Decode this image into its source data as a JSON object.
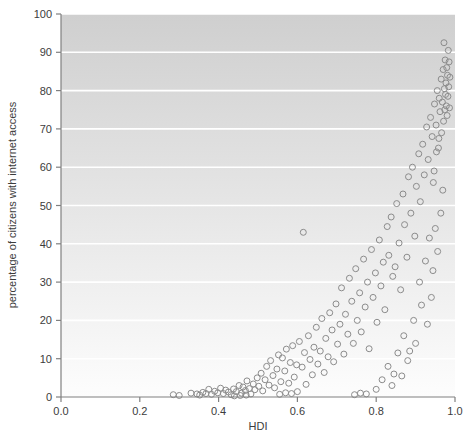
{
  "chart_data": {
    "type": "scatter",
    "title": "",
    "xlabel": "HDI",
    "ylabel": "percentage of citizens with internet access",
    "xlim": [
      0.0,
      1.0
    ],
    "ylim": [
      0,
      100
    ],
    "xticks": [
      "0.0",
      "0.2",
      "0.4",
      "0.6",
      "0.8",
      "1.0"
    ],
    "xtick_values": [
      0.0,
      0.2,
      0.4,
      0.6,
      0.8,
      1.0
    ],
    "yticks": [
      "0",
      "10",
      "20",
      "30",
      "40",
      "50",
      "60",
      "70",
      "80",
      "90",
      "100"
    ],
    "ytick_values": [
      0,
      10,
      20,
      30,
      40,
      50,
      60,
      70,
      80,
      90,
      100
    ],
    "grid": "horizontal-white",
    "legend": "none",
    "marker": "open-circle",
    "marker_color": "#8c8c8c",
    "marker_radius": 3.0,
    "plot_bg_gradient": [
      "#cfcfcf",
      "#fcfcfc"
    ],
    "axis_color": "#808080",
    "points": [
      [
        0.285,
        0.6
      ],
      [
        0.3,
        0.4
      ],
      [
        0.33,
        1.0
      ],
      [
        0.345,
        0.8
      ],
      [
        0.352,
        0.5
      ],
      [
        0.36,
        1.2
      ],
      [
        0.368,
        0.9
      ],
      [
        0.375,
        2.0
      ],
      [
        0.382,
        0.7
      ],
      [
        0.39,
        1.5
      ],
      [
        0.398,
        1.1
      ],
      [
        0.405,
        2.3
      ],
      [
        0.412,
        0.9
      ],
      [
        0.418,
        1.8
      ],
      [
        0.425,
        1.3
      ],
      [
        0.432,
        0.6
      ],
      [
        0.438,
        2.1
      ],
      [
        0.445,
        1.4
      ],
      [
        0.452,
        3.0
      ],
      [
        0.458,
        1.0
      ],
      [
        0.462,
        2.6
      ],
      [
        0.468,
        1.7
      ],
      [
        0.472,
        4.2
      ],
      [
        0.478,
        2.2
      ],
      [
        0.482,
        0.8
      ],
      [
        0.488,
        3.4
      ],
      [
        0.492,
        1.9
      ],
      [
        0.498,
        5.0
      ],
      [
        0.47,
        0.5
      ],
      [
        0.455,
        0.4
      ],
      [
        0.44,
        0.3
      ],
      [
        0.502,
        2.8
      ],
      [
        0.508,
        6.2
      ],
      [
        0.512,
        1.6
      ],
      [
        0.518,
        4.5
      ],
      [
        0.522,
        8.0
      ],
      [
        0.528,
        3.1
      ],
      [
        0.532,
        9.5
      ],
      [
        0.538,
        5.6
      ],
      [
        0.542,
        2.4
      ],
      [
        0.548,
        7.3
      ],
      [
        0.552,
        11.0
      ],
      [
        0.558,
        4.0
      ],
      [
        0.562,
        10.2
      ],
      [
        0.568,
        6.8
      ],
      [
        0.572,
        12.5
      ],
      [
        0.578,
        3.6
      ],
      [
        0.582,
        9.0
      ],
      [
        0.588,
        13.4
      ],
      [
        0.592,
        5.2
      ],
      [
        0.598,
        8.4
      ],
      [
        0.555,
        0.7
      ],
      [
        0.57,
        1.1
      ],
      [
        0.585,
        0.9
      ],
      [
        0.6,
        1.4
      ],
      [
        0.605,
        14.5
      ],
      [
        0.612,
        7.8
      ],
      [
        0.618,
        11.6
      ],
      [
        0.622,
        3.3
      ],
      [
        0.628,
        16.0
      ],
      [
        0.632,
        9.8
      ],
      [
        0.638,
        5.8
      ],
      [
        0.642,
        13.0
      ],
      [
        0.648,
        18.2
      ],
      [
        0.652,
        8.6
      ],
      [
        0.658,
        12.0
      ],
      [
        0.662,
        20.5
      ],
      [
        0.668,
        6.4
      ],
      [
        0.672,
        15.3
      ],
      [
        0.678,
        10.5
      ],
      [
        0.682,
        22.0
      ],
      [
        0.615,
        43.0
      ],
      [
        0.688,
        17.5
      ],
      [
        0.692,
        9.2
      ],
      [
        0.698,
        24.3
      ],
      [
        0.702,
        13.8
      ],
      [
        0.708,
        19.0
      ],
      [
        0.712,
        28.5
      ],
      [
        0.718,
        11.2
      ],
      [
        0.722,
        21.6
      ],
      [
        0.728,
        16.4
      ],
      [
        0.732,
        31.0
      ],
      [
        0.738,
        25.0
      ],
      [
        0.742,
        14.0
      ],
      [
        0.748,
        33.5
      ],
      [
        0.752,
        20.0
      ],
      [
        0.758,
        27.2
      ],
      [
        0.762,
        17.0
      ],
      [
        0.768,
        36.0
      ],
      [
        0.772,
        23.5
      ],
      [
        0.778,
        30.0
      ],
      [
        0.782,
        12.6
      ],
      [
        0.745,
        0.6
      ],
      [
        0.76,
        1.0
      ],
      [
        0.775,
        0.8
      ],
      [
        0.788,
        38.5
      ],
      [
        0.792,
        26.0
      ],
      [
        0.798,
        32.4
      ],
      [
        0.802,
        19.5
      ],
      [
        0.808,
        41.0
      ],
      [
        0.812,
        29.0
      ],
      [
        0.818,
        35.2
      ],
      [
        0.822,
        22.8
      ],
      [
        0.828,
        44.5
      ],
      [
        0.832,
        37.0
      ],
      [
        0.838,
        47.0
      ],
      [
        0.842,
        31.5
      ],
      [
        0.848,
        34.0
      ],
      [
        0.852,
        50.5
      ],
      [
        0.858,
        40.2
      ],
      [
        0.862,
        28.0
      ],
      [
        0.868,
        53.0
      ],
      [
        0.872,
        45.0
      ],
      [
        0.878,
        36.5
      ],
      [
        0.882,
        57.5
      ],
      [
        0.888,
        48.0
      ],
      [
        0.892,
        60.0
      ],
      [
        0.898,
        42.0
      ],
      [
        0.902,
        55.0
      ],
      [
        0.8,
        2.0
      ],
      [
        0.815,
        4.5
      ],
      [
        0.83,
        8.0
      ],
      [
        0.845,
        6.0
      ],
      [
        0.87,
        16.0
      ],
      [
        0.885,
        12.0
      ],
      [
        0.908,
        63.5
      ],
      [
        0.912,
        51.0
      ],
      [
        0.918,
        66.0
      ],
      [
        0.922,
        58.0
      ],
      [
        0.928,
        70.5
      ],
      [
        0.932,
        62.0
      ],
      [
        0.938,
        73.0
      ],
      [
        0.942,
        68.0
      ],
      [
        0.945,
        56.0
      ],
      [
        0.948,
        76.5
      ],
      [
        0.952,
        71.0
      ],
      [
        0.955,
        80.0
      ],
      [
        0.958,
        65.0
      ],
      [
        0.96,
        78.0
      ],
      [
        0.962,
        74.5
      ],
      [
        0.965,
        83.0
      ],
      [
        0.966,
        69.0
      ],
      [
        0.968,
        77.0
      ],
      [
        0.97,
        85.5
      ],
      [
        0.971,
        72.0
      ],
      [
        0.973,
        80.5
      ],
      [
        0.974,
        75.0
      ],
      [
        0.975,
        88.0
      ],
      [
        0.976,
        79.0
      ],
      [
        0.977,
        82.0
      ],
      [
        0.978,
        76.0
      ],
      [
        0.979,
        86.0
      ],
      [
        0.98,
        73.5
      ],
      [
        0.981,
        84.0
      ],
      [
        0.982,
        78.5
      ],
      [
        0.983,
        90.5
      ],
      [
        0.984,
        81.0
      ],
      [
        0.985,
        87.5
      ],
      [
        0.986,
        75.5
      ],
      [
        0.987,
        83.5
      ],
      [
        0.972,
        92.5
      ],
      [
        0.9,
        14.0
      ],
      [
        0.915,
        24.0
      ],
      [
        0.93,
        19.0
      ],
      [
        0.944,
        33.0
      ],
      [
        0.95,
        44.0
      ],
      [
        0.956,
        38.0
      ],
      [
        0.964,
        48.0
      ],
      [
        0.969,
        54.0
      ],
      [
        0.94,
        26.0
      ],
      [
        0.925,
        35.5
      ],
      [
        0.91,
        30.0
      ],
      [
        0.895,
        20.0
      ],
      [
        0.88,
        9.5
      ],
      [
        0.865,
        5.5
      ],
      [
        0.855,
        11.5
      ],
      [
        0.84,
        3.0
      ],
      [
        0.935,
        41.5
      ],
      [
        0.947,
        59.0
      ],
      [
        0.953,
        64.0
      ],
      [
        0.959,
        67.5
      ]
    ]
  }
}
